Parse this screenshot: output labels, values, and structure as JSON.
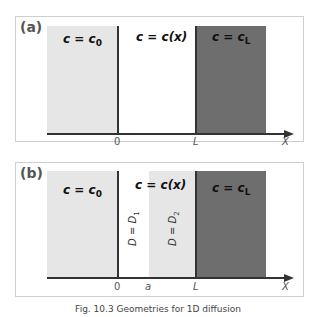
{
  "figure": {
    "caption": "Fig. 10.3 Geometries for 1D diffusion"
  },
  "panel_a": {
    "label": "(a)",
    "regions": [
      {
        "label_main": "c = c",
        "label_sub": "0",
        "fill": "#e6e6e6"
      },
      {
        "label_main": "c = c(x)",
        "label_sub": "",
        "fill": "#ffffff"
      },
      {
        "label_main": "c = c",
        "label_sub": "L",
        "fill": "#6e6e6e"
      }
    ],
    "axis": {
      "ticks": [
        "0",
        "L"
      ],
      "label": "X"
    }
  },
  "panel_b": {
    "label": "(b)",
    "regions": [
      {
        "label_main": "c = c",
        "label_sub": "0",
        "fill": "#e6e6e6"
      },
      {
        "label_main": "c = c(x)",
        "label_sub": "",
        "fill": "#ffffff"
      },
      {
        "label_main": "c = c",
        "label_sub": "L",
        "fill": "#6e6e6e"
      }
    ],
    "sublayers": [
      {
        "label_main": "D = D",
        "label_sub": "1",
        "fill": "#ffffff"
      },
      {
        "label_main": "D = D",
        "label_sub": "2",
        "fill": "#e6e6e6"
      }
    ],
    "axis": {
      "ticks": [
        "0",
        "a",
        "L"
      ],
      "label": "X"
    }
  }
}
